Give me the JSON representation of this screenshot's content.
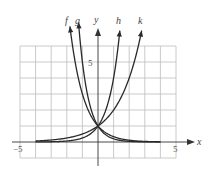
{
  "chart_data": {
    "type": "line",
    "title": "",
    "xlabel": "x",
    "ylabel": "y",
    "xlim": [
      -5,
      5
    ],
    "ylim": [
      -1,
      6
    ],
    "grid": true,
    "tick_labels": {
      "x": [
        {
          "value": -5,
          "label": "−5"
        },
        {
          "value": 5,
          "label": "5"
        }
      ],
      "y": [
        {
          "value": 5,
          "label": "5"
        }
      ]
    },
    "intersection": {
      "x": 0,
      "y": 1
    },
    "series": [
      {
        "name": "f",
        "function": "3^(-x)",
        "x_range": [
          -1.8,
          4
        ],
        "direction": "decreasing"
      },
      {
        "name": "g",
        "function": "5^(-x)",
        "x_range": [
          -1.25,
          4
        ],
        "direction": "decreasing"
      },
      {
        "name": "h",
        "function": "4^x",
        "x_range": [
          -4,
          1.4
        ],
        "direction": "increasing"
      },
      {
        "name": "k",
        "function": "2^x",
        "x_range": [
          -4,
          2.8
        ],
        "direction": "increasing"
      }
    ],
    "legend": "curve labels above arrowheads: f, g, h, k"
  },
  "labels": {
    "x_axis": "x",
    "y_axis": "y",
    "x_min": "−5",
    "x_max": "5",
    "y_five": "5",
    "f": "f",
    "g": "g",
    "h": "h",
    "k": "k"
  }
}
